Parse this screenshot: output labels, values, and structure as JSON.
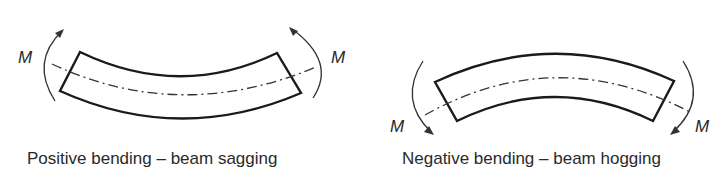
{
  "figures": [
    {
      "id": "positive",
      "caption": "Positive bending – beam sagging",
      "moment_label_left": "M",
      "moment_label_right": "M",
      "beam_shape": "concave-up",
      "moment_direction_left": "clockwise-up",
      "moment_direction_right": "counterclockwise-up"
    },
    {
      "id": "negative",
      "caption": "Negative bending – beam hogging",
      "moment_label_left": "M",
      "moment_label_right": "M",
      "beam_shape": "concave-down",
      "moment_direction_left": "counterclockwise-down",
      "moment_direction_right": "clockwise-down"
    }
  ],
  "colors": {
    "stroke": "#1a1a1a",
    "text": "#2a2a2a",
    "background": "#ffffff"
  }
}
